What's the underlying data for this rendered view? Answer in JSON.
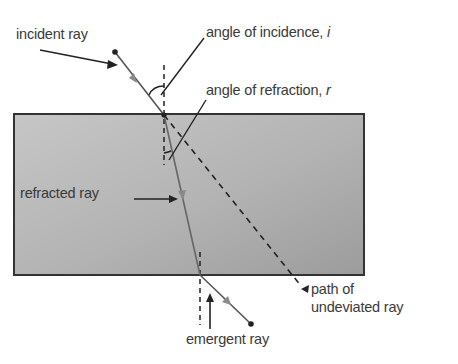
{
  "diagram": {
    "colors": {
      "block_fill_light": "#c4c4c4",
      "block_fill_dark": "#9e9e9e",
      "block_border": "#333333",
      "ray": "#555555",
      "ray_arrow": "#8a8a8a",
      "label_text": "#3a3a3a",
      "leader_line": "#222222"
    },
    "labels": {
      "incident_ray": "incident ray",
      "angle_of_incidence": "angle of incidence, ",
      "angle_of_incidence_symbol": "i",
      "angle_of_refraction": "angle of refraction, ",
      "angle_of_refraction_symbol": "r",
      "refracted_ray": "refracted ray",
      "path_of_undeviated_ray_line1": "path of",
      "path_of_undeviated_ray_line2": "undeviated ray",
      "emergent_ray": "emergent ray"
    },
    "geometry": {
      "block": {
        "x": 14,
        "y": 114,
        "width": 350,
        "height": 161
      },
      "incident_ray": {
        "x1": 115,
        "y1": 52,
        "x2": 164,
        "y2": 115
      },
      "refracted_ray": {
        "x1": 164,
        "y1": 115,
        "x2": 200,
        "y2": 275
      },
      "emergent_ray": {
        "x1": 200,
        "y1": 275,
        "x2": 251,
        "y2": 324
      },
      "undeviated_path": {
        "x1": 164,
        "y1": 115,
        "x2": 303,
        "y2": 288
      },
      "normal_top": {
        "x": 164,
        "y1": 65,
        "y2": 165
      },
      "normal_bottom": {
        "x": 200,
        "y1": 252,
        "y2": 325
      }
    }
  }
}
